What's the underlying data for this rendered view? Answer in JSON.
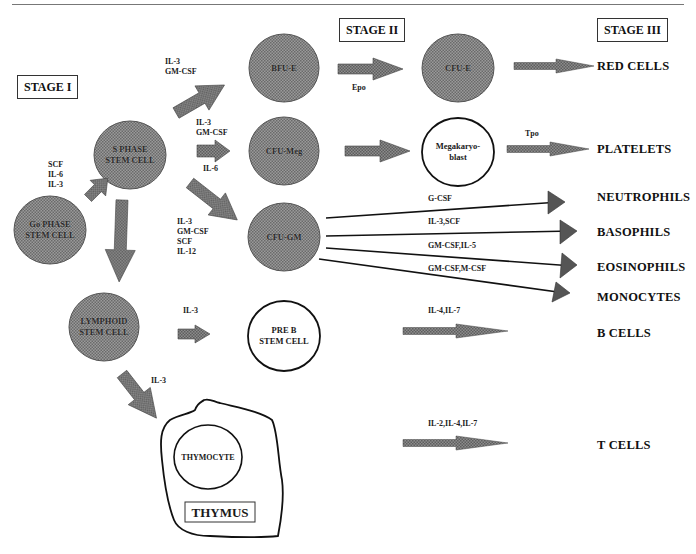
{
  "stages": {
    "stage1": "STAGE I",
    "stage2": "STAGE II",
    "stage3": "STAGE III"
  },
  "nodes": {
    "go_phase": "Go PHASE\nSTEM CELL",
    "s_phase": "S PHASE\nSTEM CELL",
    "bfu_e": "BFU-E",
    "cfu_e": "CFU-E",
    "cfu_meg": "CFU-Meg",
    "megakaryoblast": "Megakaryo-\nblast",
    "cfu_gm": "CFU-GM",
    "lymphoid": "LYMPHOID\nSTEM CELL",
    "pre_b": "PRE B\nSTEM CELL",
    "thymocyte": "THYMOCYTE",
    "thymus": "THYMUS"
  },
  "factors": {
    "go_to_s": "SCF\nIL-6\nIL-3",
    "s_to_bfu": "IL-3\nGM-CSF",
    "s_to_meg_top": "IL-3\nGM-CSF",
    "s_to_meg_bottom": "IL-6",
    "s_to_gm": "IL-3\nGM-CSF\nSCF\nIL-12",
    "bfu_to_cfue": "Epo",
    "meg_to_platelets": "Tpo",
    "gm_neutrophils": "G-CSF",
    "gm_basophils": "IL-3,SCF",
    "gm_eosinophils": "GM-CSF,IL-5",
    "gm_monocytes": "GM-CSF,M-CSF",
    "lymphoid_to_preb": "IL-3",
    "lymphoid_to_thymus": "IL-3",
    "b_cells": "IL-4,IL-7",
    "t_cells": "IL-2,IL-4,IL-7"
  },
  "outputs": {
    "red_cells": "RED CELLS",
    "platelets": "PLATELETS",
    "neutrophils": "NEUTROPHILS",
    "basophils": "BASOPHILS",
    "eosinophils": "EOSINOPHILS",
    "monocytes": "MONOCYTES",
    "b_cells": "B CELLS",
    "t_cells": "T CELLS"
  },
  "colors": {
    "node_fill": "#8a8a8a",
    "arrow_fill": "#6e6e6e",
    "line": "#222222"
  }
}
